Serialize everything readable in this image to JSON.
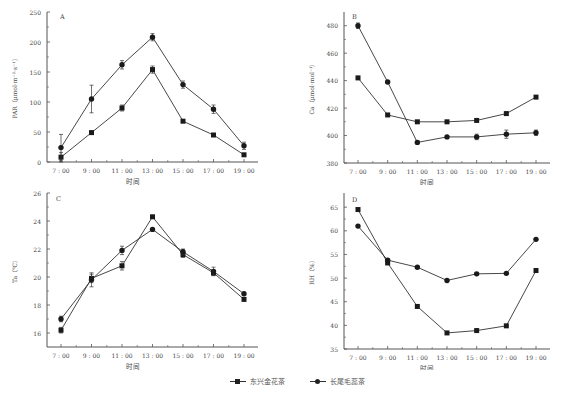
{
  "chart_data": [
    {
      "panel": "A",
      "type": "line",
      "title": "",
      "panel_label": "A",
      "xlabel": "时间",
      "ylabel": "PAR（μmol·m⁻²·s⁻¹）",
      "categories": [
        "7:00",
        "9:00",
        "11:00",
        "13:00",
        "15:00",
        "17:00",
        "19:00"
      ],
      "ylim": [
        0,
        250
      ],
      "yticks": [
        0,
        50,
        100,
        150,
        200,
        250
      ],
      "grid": false,
      "series": [
        {
          "name": "东兴金花茶",
          "marker": "square",
          "values": [
            8,
            49,
            90,
            154,
            68,
            45,
            12
          ],
          "errors": [
            8,
            2,
            5,
            6,
            2,
            2,
            2
          ]
        },
        {
          "name": "长尾毛蕊茶",
          "marker": "circle",
          "values": [
            24,
            105,
            162,
            208,
            129,
            88,
            27
          ],
          "errors": [
            22,
            23,
            7,
            6,
            6,
            7,
            6
          ]
        }
      ]
    },
    {
      "panel": "B",
      "type": "line",
      "title": "",
      "panel_label": "B",
      "xlabel": "时间",
      "ylabel": "Ca（μmol·mol⁻¹）",
      "categories": [
        "7:00",
        "9:00",
        "11:00",
        "13:00",
        "15:00",
        "17:00",
        "19:00"
      ],
      "ylim": [
        380,
        490
      ],
      "yticks": [
        380,
        400,
        420,
        440,
        460,
        480
      ],
      "grid": false,
      "series": [
        {
          "name": "东兴金花茶",
          "marker": "square",
          "values": [
            442,
            415,
            410,
            410,
            411,
            416,
            428
          ],
          "errors": [
            0,
            0,
            0,
            0,
            0,
            0,
            0
          ]
        },
        {
          "name": "长尾毛蕊茶",
          "marker": "circle",
          "values": [
            480,
            439,
            395,
            399,
            399,
            401,
            402
          ],
          "errors": [
            2,
            1,
            1,
            1,
            2,
            3,
            2
          ]
        }
      ]
    },
    {
      "panel": "C",
      "type": "line",
      "title": "",
      "panel_label": "C",
      "xlabel": "时间",
      "ylabel": "Ta（℃）",
      "categories": [
        "7:00",
        "9:00",
        "11:00",
        "13:00",
        "15:00",
        "17:00",
        "19:00"
      ],
      "ylim": [
        15,
        26
      ],
      "yticks": [
        16,
        18,
        20,
        22,
        24,
        26
      ],
      "grid": false,
      "series": [
        {
          "name": "东兴金花茶",
          "marker": "square",
          "values": [
            16.2,
            19.9,
            20.8,
            24.3,
            21.6,
            20.3,
            18.4
          ],
          "errors": [
            0.2,
            0.3,
            0.3,
            0.05,
            0.2,
            0.2,
            0.05
          ]
        },
        {
          "name": "长尾毛蕊茶",
          "marker": "circle",
          "values": [
            17.0,
            19.8,
            21.9,
            23.4,
            21.8,
            20.4,
            18.8
          ],
          "errors": [
            0.2,
            0.5,
            0.3,
            0.05,
            0.2,
            0.3,
            0.05
          ]
        }
      ]
    },
    {
      "panel": "D",
      "type": "line",
      "title": "",
      "panel_label": "D",
      "xlabel": "时间",
      "ylabel": "RH（%）",
      "categories": [
        "7:00",
        "9:00",
        "11:00",
        "13:00",
        "15:00",
        "17:00",
        "19:00"
      ],
      "ylim": [
        35,
        68
      ],
      "yticks": [
        35,
        40,
        45,
        50,
        55,
        60,
        65
      ],
      "grid": false,
      "series": [
        {
          "name": "东兴金花茶",
          "marker": "square",
          "values": [
            64.5,
            53.2,
            44.0,
            38.4,
            38.9,
            39.9,
            51.6
          ],
          "errors": [
            0,
            0.3,
            0,
            0,
            0,
            0,
            0
          ]
        },
        {
          "name": "长尾毛蕊茶",
          "marker": "circle",
          "values": [
            61.0,
            53.8,
            52.3,
            49.5,
            50.9,
            51.0,
            58.2
          ],
          "errors": [
            0,
            0.3,
            0,
            0,
            0,
            0,
            0
          ]
        }
      ]
    }
  ],
  "legend": {
    "items": [
      {
        "label": "东兴金花茶",
        "marker": "square"
      },
      {
        "label": "长尾毛蕊茶",
        "marker": "circle"
      }
    ],
    "position": "bottom"
  },
  "colors": {
    "line": "#333333",
    "marker": "#1a1a1a",
    "axis": "#555555"
  }
}
